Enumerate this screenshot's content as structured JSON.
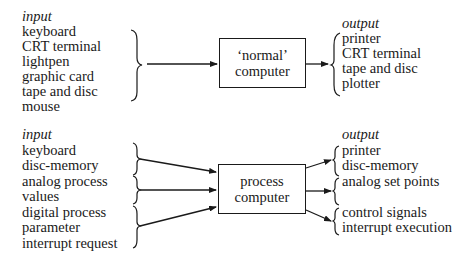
{
  "top": {
    "input_heading": "input",
    "inputs": [
      "keyboard",
      "CRT terminal",
      "lightpen",
      "graphic card",
      "tape and disc",
      "mouse"
    ],
    "box": {
      "line1": "‘normal’",
      "line2": "computer"
    },
    "output_heading": "output",
    "outputs": [
      "printer",
      "CRT terminal",
      "tape and disc",
      "plotter"
    ]
  },
  "bottom": {
    "input_heading": "input",
    "inputs": [
      "keyboard",
      "disc-memory",
      "analog process",
      "values",
      "digital process",
      "parameter",
      "interrupt request"
    ],
    "box": {
      "line1": "process",
      "line2": "computer"
    },
    "output_heading": "output",
    "outputs": [
      "printer",
      "disc-memory",
      "analog set points",
      "",
      "control signals",
      "interrupt execution"
    ]
  }
}
